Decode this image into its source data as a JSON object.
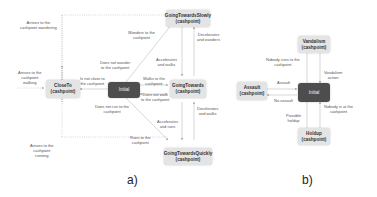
{
  "diagram_a": {
    "caption": "a)",
    "nodes": {
      "initial": "Initial",
      "close_to": [
        "CloseTo",
        "(cashpoint)"
      ],
      "slowly": [
        "GoingTowardsSlowly",
        "(cashpoint)"
      ],
      "towards": [
        "GoingTowards",
        "(cashpoint)"
      ],
      "quickly": [
        "GoingTowardsQuickly",
        "(cashpoint)"
      ]
    },
    "labels": {
      "arrives_wandering": [
        "Arrives to the",
        "cashpoint wandering"
      ],
      "arrives_walking": [
        "Arrives to the",
        "cashpoint",
        "walking"
      ],
      "arrives_running": [
        "Arrives to the",
        "cashpoint",
        "running"
      ],
      "not_close": [
        "Is not close to",
        "the cashpoint"
      ],
      "wanders_to": [
        "Wanders to the",
        "cashpoint"
      ],
      "not_wander": [
        "Does not wander",
        "to the cashpoint"
      ],
      "walks_to": [
        "Walks to the",
        "cashpoint"
      ],
      "not_walk": [
        "Does not walk",
        "to the cashpoint"
      ],
      "not_run": [
        "Does not run to the",
        "cashpoint"
      ],
      "runs_to": [
        "Runs to the",
        "cashpoint"
      ],
      "acc_walks": [
        "Accelerates",
        "and walks"
      ],
      "dec_wanders": [
        "Decelerates",
        "and wanders"
      ],
      "dec_walks": [
        "Decelerates",
        "and walks"
      ],
      "acc_runs": [
        "Accelerates",
        "and runs"
      ]
    }
  },
  "diagram_b": {
    "caption": "b)",
    "nodes": {
      "initial": "Initial",
      "vandalism": [
        "Vandalism",
        "(cashpoint)"
      ],
      "assault": [
        "Assault",
        "(cashpoint)"
      ],
      "holdup": [
        "Holdup",
        "(cashpoint)"
      ]
    },
    "labels": {
      "nobody_runs": [
        "Nobody runs to the",
        "cashpoint"
      ],
      "vandalism_action": [
        "Vandalism",
        "action"
      ],
      "assault": [
        "Assault"
      ],
      "no_assault": [
        "No assault"
      ],
      "possible_holdup": [
        "Possible",
        "holdup"
      ],
      "nobody_at": [
        "Nobody is at the",
        "cashpoint"
      ]
    }
  }
}
